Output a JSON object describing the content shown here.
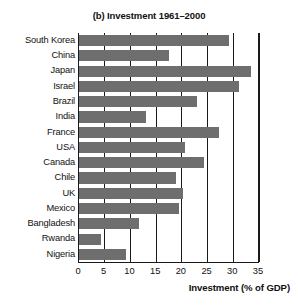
{
  "chart_data": {
    "type": "bar",
    "orientation": "horizontal",
    "title": "(b) Investment 1961–2000",
    "xlabel": "Investment (% of GDP)",
    "ylabel": "",
    "xlim": [
      0,
      35
    ],
    "ylim": null,
    "grid": true,
    "legend": null,
    "xticks": [
      0,
      5,
      10,
      15,
      20,
      25,
      30,
      35
    ],
    "xtick_labels": [
      "0",
      "5",
      "10",
      "15",
      "20",
      "25",
      "30",
      "35"
    ],
    "bar_color": "#6e6e6e",
    "axis_color": "#1a1a1a",
    "categories": [
      "South Korea",
      "China",
      "Japan",
      "Israel",
      "Brazil",
      "India",
      "France",
      "USA",
      "Canada",
      "Chile",
      "UK",
      "Mexico",
      "Bangladesh",
      "Rwanda",
      "Nigeria"
    ],
    "values": [
      29.2,
      17.5,
      33.5,
      31.1,
      22.9,
      13.0,
      27.2,
      20.6,
      24.4,
      18.8,
      20.2,
      19.4,
      11.7,
      4.3,
      9.1
    ]
  }
}
